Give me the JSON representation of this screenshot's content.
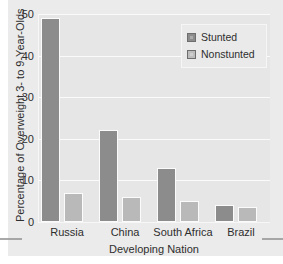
{
  "chart_data": {
    "type": "bar",
    "title": "",
    "xlabel": "Developing Nation",
    "ylabel": "Percentage of Overweight 3- to 9-Year-Olds",
    "categories": [
      "Russia",
      "China",
      "South Africa",
      "Brazil"
    ],
    "series": [
      {
        "name": "Stunted",
        "values": [
          49,
          22,
          13,
          4
        ],
        "color": "#8c8c8c"
      },
      {
        "name": "Nonstunted",
        "values": [
          7,
          6,
          5,
          3.5
        ],
        "color": "#b9b9b9"
      }
    ],
    "ylim": [
      0,
      50
    ],
    "yticks": [
      0,
      10,
      20,
      30,
      40,
      50
    ],
    "ytick_labels": [
      "0",
      "10",
      "20",
      "30",
      "40",
      "50"
    ],
    "grid": true,
    "legend_position": "top-right"
  },
  "legend": {
    "entries": [
      {
        "label": "Stunted"
      },
      {
        "label": "Nonstunted"
      }
    ]
  },
  "colors": {
    "stunted": "#8c8c8c",
    "nonstunted": "#b9b9b9",
    "plot_background": "#e6e6e6",
    "page_background": "#ebebeb",
    "gridline": "#fafafa",
    "text": "#2e2e2e"
  }
}
